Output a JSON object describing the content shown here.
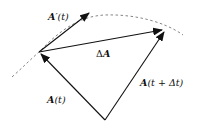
{
  "diagram": {
    "labels": {
      "derivative": {
        "vec": "A",
        "rest": "′(t)"
      },
      "delta": {
        "pre": "Δ",
        "vec": "A"
      },
      "a_t": {
        "vec": "A",
        "rest": "(t)"
      },
      "a_t_dt": {
        "vec": "A",
        "rest": "(t + Δt)"
      }
    },
    "vectors": [
      {
        "name": "A(t)",
        "from": "origin",
        "to": "P(t)"
      },
      {
        "name": "A(t+Δt)",
        "from": "origin",
        "to": "P(t+Δt)"
      },
      {
        "name": "ΔA",
        "from": "P(t)",
        "to": "P(t+Δt)"
      },
      {
        "name": "A'(t)",
        "from": "P(t)",
        "to": "tangent direction"
      }
    ],
    "curve": "dashed trajectory through P(t) and P(t+Δt)",
    "colors": {
      "stroke": "#111111",
      "curve": "#777777"
    }
  }
}
